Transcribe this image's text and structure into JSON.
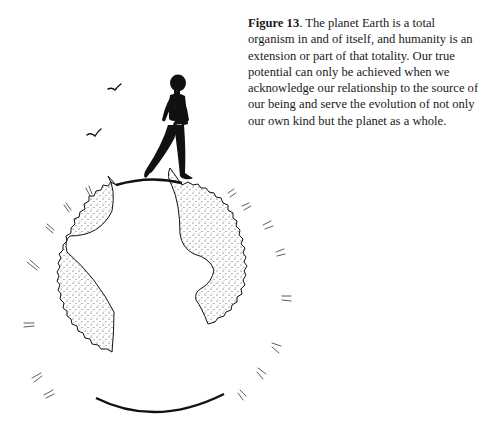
{
  "figure": {
    "label": "Figure 13",
    "caption_text": ". The planet Earth is a total organism in and of itself, and humanity is an extension or part of that totality. Our true potential can only be achieved when we acknowledge our relationship to the source of our being and serve the evolution of not only our own kind but the planet as a whole.",
    "illustration": {
      "subject": "silhouette of a person walking on top of a small globe",
      "elements": [
        "walking-person-silhouette",
        "bird",
        "bird",
        "globe",
        "stippled-continent-left",
        "stippled-continent-right"
      ]
    }
  }
}
